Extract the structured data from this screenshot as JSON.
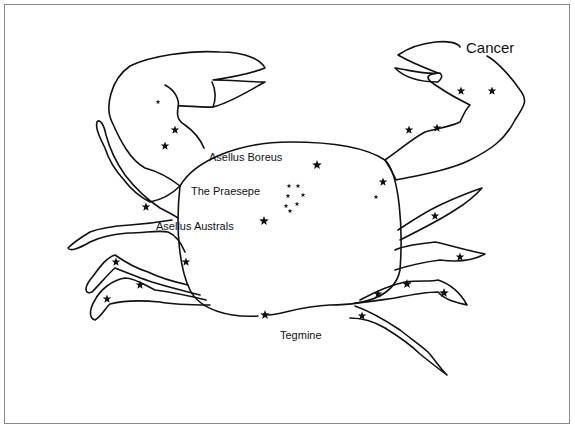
{
  "diagram": {
    "title": "Cancer",
    "labels": {
      "title": "Cancer",
      "asellus_boreus": "Asellus Boreus",
      "praesepe": "The Praesepe",
      "asellus_australs": "Asellus Australs",
      "tegmine": "Tegmine"
    },
    "colors": {
      "line": "#111111",
      "background": "#ffffff",
      "frame": "#8a8a8a"
    },
    "stars": [
      {
        "x": 158,
        "y": 102,
        "size": 2.5
      },
      {
        "x": 175,
        "y": 130,
        "size": 4.5
      },
      {
        "x": 165,
        "y": 146,
        "size": 4.5
      },
      {
        "x": 461,
        "y": 91,
        "size": 4.5
      },
      {
        "x": 492,
        "y": 91,
        "size": 4.5
      },
      {
        "x": 409,
        "y": 130,
        "size": 4.5
      },
      {
        "x": 437,
        "y": 128,
        "size": 4.5
      },
      {
        "x": 317,
        "y": 165,
        "size": 5
      },
      {
        "x": 383,
        "y": 182,
        "size": 4.5
      },
      {
        "x": 376,
        "y": 197,
        "size": 2.5
      },
      {
        "x": 289,
        "y": 186,
        "size": 2.5
      },
      {
        "x": 298,
        "y": 186,
        "size": 2.5
      },
      {
        "x": 288,
        "y": 196,
        "size": 2.5
      },
      {
        "x": 303,
        "y": 195,
        "size": 2.5
      },
      {
        "x": 297,
        "y": 204,
        "size": 2.5
      },
      {
        "x": 286,
        "y": 206,
        "size": 2.5
      },
      {
        "x": 290,
        "y": 211,
        "size": 2.5
      },
      {
        "x": 264,
        "y": 221,
        "size": 5
      },
      {
        "x": 146,
        "y": 207,
        "size": 4.5
      },
      {
        "x": 186,
        "y": 262,
        "size": 4.5
      },
      {
        "x": 116,
        "y": 262,
        "size": 4.5
      },
      {
        "x": 140,
        "y": 285,
        "size": 4.5
      },
      {
        "x": 107,
        "y": 299,
        "size": 4.5
      },
      {
        "x": 435,
        "y": 216,
        "size": 4.5
      },
      {
        "x": 460,
        "y": 257,
        "size": 4.5
      },
      {
        "x": 407,
        "y": 284,
        "size": 5
      },
      {
        "x": 378,
        "y": 294,
        "size": 4.5
      },
      {
        "x": 444,
        "y": 293,
        "size": 5
      },
      {
        "x": 362,
        "y": 316,
        "size": 4.5
      },
      {
        "x": 265,
        "y": 315,
        "size": 5
      }
    ]
  }
}
